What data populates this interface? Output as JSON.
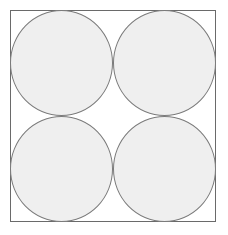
{
  "diagram": {
    "type": "circle-packing-grid",
    "rows": 2,
    "cols": 2,
    "circles": [
      {
        "id": "top-left",
        "fill": "#efefef",
        "stroke": "#7a7a7a"
      },
      {
        "id": "top-right",
        "fill": "#efefef",
        "stroke": "#7a7a7a"
      },
      {
        "id": "bottom-left",
        "fill": "#efefef",
        "stroke": "#7a7a7a"
      },
      {
        "id": "bottom-right",
        "fill": "#efefef",
        "stroke": "#7a7a7a"
      }
    ],
    "frame_stroke": "#6a6a6a"
  }
}
